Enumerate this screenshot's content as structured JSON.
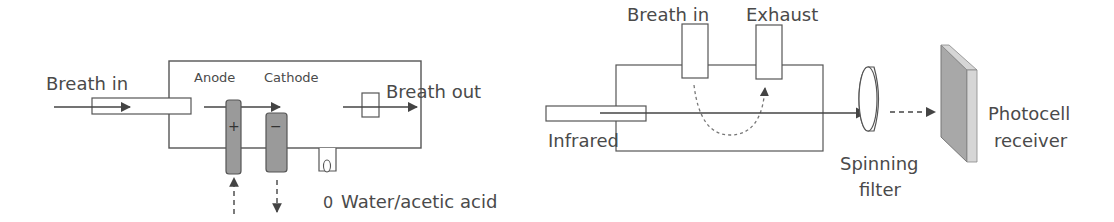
{
  "left_diagram": {
    "name": "Fuel cell breathalyzer",
    "labels": {
      "breath_in": "Breath in",
      "anode": "Anode",
      "cathode": "Cathode",
      "breath_out": "Breath out",
      "water_acetic": "Water/acetic acid",
      "water_symbol": "0",
      "anode_sign": "+",
      "cathode_sign": "−"
    }
  },
  "right_diagram": {
    "name": "Infrared spectroscopy breathalyzer",
    "labels": {
      "breath_in": "Breath in",
      "exhaust": "Exhaust",
      "infrared": "Infrared",
      "spinning_filter_line1": "Spinning",
      "spinning_filter_line2": "filter",
      "photocell_line1": "Photocell",
      "photocell_line2": "receiver"
    }
  },
  "colors": {
    "line": "#555555",
    "text": "#4a4a4a",
    "electrode_fill": "#9a9a9a",
    "photocell_face": "#a8a8a8",
    "photocell_edge": "#d6d6d6"
  }
}
